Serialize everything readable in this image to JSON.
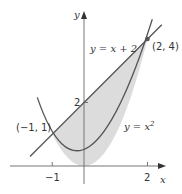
{
  "diagram": {
    "axes": {
      "x_label": "x",
      "y_label": "y",
      "x_ticks": [
        {
          "value": -1,
          "label": "-1"
        },
        {
          "value": 2,
          "label": "2"
        }
      ],
      "y_ticks": [
        {
          "value": 2,
          "label": "2"
        }
      ]
    },
    "curves": [
      {
        "name": "parabola",
        "label": "y = x²",
        "equation": "y = x^2"
      },
      {
        "name": "line",
        "label": "y = x + 2",
        "equation": "y = x + 2"
      }
    ],
    "points": [
      {
        "label": "(-1, 1)",
        "x": -1,
        "y": 1
      },
      {
        "label": "(2, 4)",
        "x": 2,
        "y": 4,
        "marked": true
      }
    ],
    "shaded_region": "between y = x + 2 (above) and y = x^2 (below), for -1 ≤ x ≤ 2",
    "colors": {
      "fill": "#dcdcdc",
      "curve": "#555555",
      "axis": "#777777",
      "text": "#333333"
    },
    "labels": {
      "line_eq": "y = x + 2",
      "parabola_y": "y = x",
      "parabola_exp": "2",
      "point_a": "(−1, 1)",
      "point_b": "(2, 4)",
      "tick_neg1": "−1",
      "tick_2x": "2",
      "tick_2y": "2",
      "x_axis": "x",
      "y_axis": "y"
    }
  }
}
